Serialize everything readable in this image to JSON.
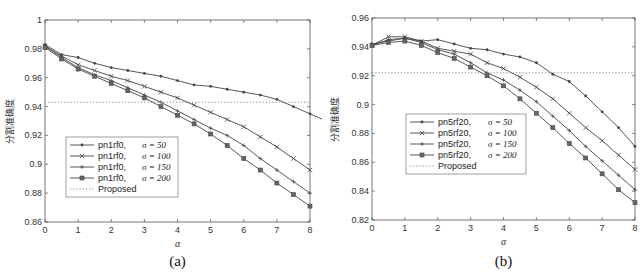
{
  "chart_data": [
    {
      "type": "line",
      "caption": "(a)",
      "title": "",
      "xlabel": "α",
      "ylabel": "分割准确度",
      "xlim": [
        0,
        8
      ],
      "ylim": [
        0.86,
        1.0
      ],
      "xticks": [
        "0",
        "1",
        "2",
        "3",
        "4",
        "5",
        "6",
        "7",
        "8"
      ],
      "yticks": [
        "0.86",
        "0.88",
        "0.9",
        "0.92",
        "0.94",
        "0.96",
        "0.98",
        "1"
      ],
      "grid": false,
      "legend_position": "lower-left",
      "x": [
        0,
        0.5,
        1,
        1.5,
        2,
        2.5,
        3,
        3.5,
        4,
        4.5,
        5,
        5.5,
        6,
        6.5,
        7,
        7.5,
        8
      ],
      "series": [
        {
          "name": "pn1rf0,   σ = 50",
          "label": "pn1rf0,",
          "sigma": "σ = 50",
          "marker": "dot",
          "values": [
            0.983,
            0.976,
            0.974,
            0.97,
            0.967,
            0.965,
            0.963,
            0.961,
            0.958,
            0.955,
            0.954,
            0.952,
            0.95,
            0.948,
            0.945,
            0.94,
            0.935,
            0.93
          ]
        },
        {
          "name": "pn1rf0,   σ = 100",
          "label": "pn1rf0,",
          "sigma": "σ = 100",
          "marker": "x",
          "values": [
            0.982,
            0.975,
            0.969,
            0.965,
            0.961,
            0.958,
            0.954,
            0.95,
            0.946,
            0.941,
            0.936,
            0.931,
            0.926,
            0.919,
            0.912,
            0.904,
            0.896
          ]
        },
        {
          "name": "pn1rf0,   σ = 150",
          "label": "pn1rf0,",
          "sigma": "σ = 150",
          "marker": "plus",
          "values": [
            0.982,
            0.974,
            0.967,
            0.962,
            0.958,
            0.953,
            0.948,
            0.943,
            0.937,
            0.931,
            0.925,
            0.92,
            0.913,
            0.904,
            0.896,
            0.888,
            0.88
          ]
        },
        {
          "name": "pn1rf0,   σ = 200",
          "label": "pn1rf0,",
          "sigma": "σ = 200",
          "marker": "square",
          "values": [
            0.981,
            0.973,
            0.966,
            0.961,
            0.956,
            0.951,
            0.946,
            0.94,
            0.934,
            0.928,
            0.921,
            0.913,
            0.904,
            0.896,
            0.887,
            0.879,
            0.871
          ]
        },
        {
          "name": "Proposed",
          "label": "Proposed",
          "sigma": "",
          "marker": "none",
          "style": "dotted",
          "values": [
            0.943,
            0.943,
            0.943,
            0.943,
            0.943,
            0.943,
            0.943,
            0.943,
            0.943,
            0.943,
            0.943,
            0.943,
            0.943,
            0.943,
            0.943,
            0.943,
            0.943
          ]
        }
      ]
    },
    {
      "type": "line",
      "caption": "(b)",
      "title": "",
      "xlabel": "α",
      "ylabel": "分割准确度",
      "xlim": [
        0,
        8
      ],
      "ylim": [
        0.82,
        0.96
      ],
      "xticks": [
        "0",
        "1",
        "2",
        "3",
        "4",
        "5",
        "6",
        "7",
        "8"
      ],
      "yticks": [
        "0.82",
        "0.84",
        "0.86",
        "0.88",
        "0.9",
        "0.92",
        "0.94",
        "0.96"
      ],
      "grid": false,
      "legend_position": "lower-left",
      "x": [
        0,
        0.5,
        1,
        1.5,
        2,
        2.5,
        3,
        3.5,
        4,
        4.5,
        5,
        5.5,
        6,
        6.5,
        7,
        7.5,
        8
      ],
      "series": [
        {
          "name": "pn5rf20,   σ = 50",
          "label": "pn5rf20,",
          "sigma": "σ = 50",
          "marker": "dot",
          "values": [
            0.942,
            0.944,
            0.946,
            0.944,
            0.945,
            0.942,
            0.939,
            0.938,
            0.935,
            0.933,
            0.929,
            0.921,
            0.916,
            0.906,
            0.895,
            0.884,
            0.871
          ]
        },
        {
          "name": "pn5rf20,   σ = 100",
          "label": "pn5rf20,",
          "sigma": "σ = 100",
          "marker": "x",
          "values": [
            0.941,
            0.947,
            0.947,
            0.944,
            0.939,
            0.937,
            0.935,
            0.929,
            0.925,
            0.919,
            0.912,
            0.904,
            0.894,
            0.884,
            0.875,
            0.865,
            0.855
          ]
        },
        {
          "name": "pn5rf20,   σ = 150",
          "label": "pn5rf20,",
          "sigma": "σ = 150",
          "marker": "plus",
          "values": [
            0.941,
            0.945,
            0.946,
            0.943,
            0.938,
            0.935,
            0.929,
            0.922,
            0.917,
            0.91,
            0.902,
            0.892,
            0.882,
            0.871,
            0.861,
            0.851,
            0.841
          ]
        },
        {
          "name": "pn5rf20,   σ = 200",
          "label": "pn5rf20,",
          "sigma": "σ = 200",
          "marker": "square",
          "values": [
            0.941,
            0.943,
            0.944,
            0.941,
            0.936,
            0.932,
            0.926,
            0.92,
            0.913,
            0.904,
            0.894,
            0.884,
            0.873,
            0.863,
            0.852,
            0.841,
            0.832
          ]
        },
        {
          "name": "Proposed",
          "label": "Proposed",
          "sigma": "",
          "marker": "none",
          "style": "dotted",
          "values": [
            0.922,
            0.922,
            0.922,
            0.922,
            0.922,
            0.922,
            0.922,
            0.922,
            0.922,
            0.922,
            0.922,
            0.922,
            0.922,
            0.922,
            0.922,
            0.922,
            0.922
          ]
        }
      ]
    }
  ],
  "style": {
    "line_color": "#444444",
    "proposed_color": "#888888",
    "axis_color": "#555555",
    "background": "#ffffff"
  }
}
